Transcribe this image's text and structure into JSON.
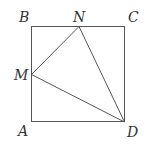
{
  "diagram": {
    "type": "geometry",
    "colors": {
      "stroke": "#555555",
      "label": "#333333",
      "background": "#ffffff"
    },
    "labels": {
      "A": "A",
      "B": "B",
      "C": "C",
      "D": "D",
      "M": "M",
      "N": "N"
    },
    "segments": [
      "AB",
      "BC",
      "CD",
      "DA",
      "MN",
      "ND",
      "MD"
    ]
  }
}
